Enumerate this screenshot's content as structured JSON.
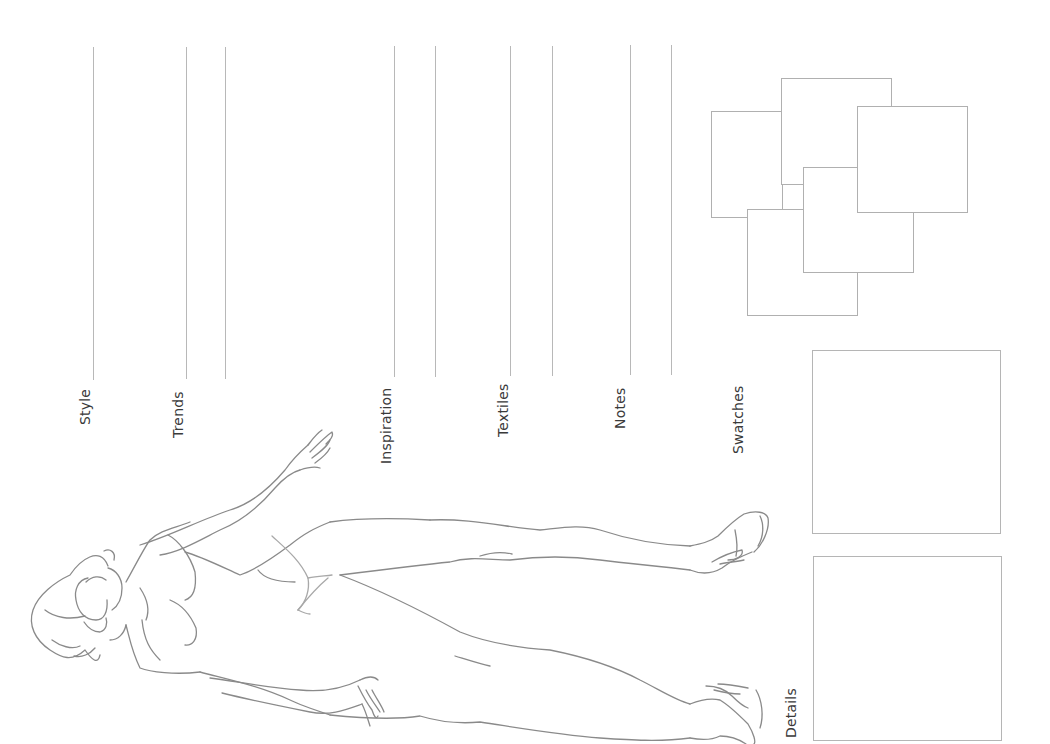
{
  "page": {
    "orientation": "rotated -90deg",
    "line_color": "#b8b8b8",
    "text_color": "#3a3a3a",
    "sketch_color": "#8a8a8a"
  },
  "sections": [
    {
      "id": "style",
      "label": "Style",
      "lines": 1
    },
    {
      "id": "trends",
      "label": "Trends",
      "lines": 2
    },
    {
      "id": "inspiration",
      "label": "Inspiration",
      "lines": 2
    },
    {
      "id": "textiles",
      "label": "Textiles",
      "lines": 2
    },
    {
      "id": "notes",
      "label": "Notes",
      "lines": 2
    },
    {
      "id": "swatches",
      "label": "Swatches",
      "boxes": 5
    },
    {
      "id": "details",
      "label": "Details",
      "boxes": 2
    }
  ],
  "labels": {
    "style": "Style",
    "trends": "Trends",
    "inspiration": "Inspiration",
    "textiles": "Textiles",
    "notes": "Notes",
    "swatches": "Swatches",
    "details": "Details"
  }
}
